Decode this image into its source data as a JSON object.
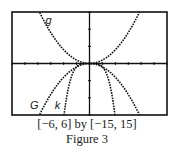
{
  "figure": {
    "window_caption": "[−6, 6] by [−15, 15]",
    "figure_label": "Figure 3"
  },
  "chart_data": {
    "type": "line",
    "title": "",
    "xlabel": "",
    "ylabel": "",
    "xlim": [
      -6,
      6
    ],
    "ylim": [
      -15,
      15
    ],
    "xscale_tick": 1,
    "yscale_tick": 5,
    "grid": false,
    "legend": "inline labels",
    "series": [
      {
        "name": "g",
        "formula": "x^2",
        "label_pos": [
          -3.4,
          11.5
        ],
        "style": "dotted"
      },
      {
        "name": "G",
        "formula": "-x^2",
        "label_pos": [
          -4.6,
          -13.3
        ],
        "style": "dotted"
      },
      {
        "name": "k",
        "formula": "-x^4",
        "label_pos": [
          -2.7,
          -13.3
        ],
        "style": "dotted"
      }
    ],
    "frame": {
      "x": 12,
      "y": 12,
      "width": 155,
      "height": 103
    },
    "colors": {
      "axis": "#111111",
      "curve": "#111111",
      "frame": "#111111"
    }
  }
}
